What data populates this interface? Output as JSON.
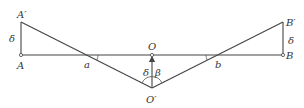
{
  "diagram": {
    "type": "geometry",
    "colors": {
      "line": "#444444",
      "text": "#333333",
      "background": "#ffffff"
    },
    "points": {
      "A_prime": {
        "label": "A′",
        "x": 21,
        "y": 22
      },
      "A": {
        "label": "A",
        "x": 21,
        "y": 55
      },
      "B_prime": {
        "label": "B′",
        "x": 283,
        "y": 22
      },
      "B": {
        "label": "B",
        "x": 283,
        "y": 55
      },
      "O": {
        "label": "O",
        "x": 152,
        "y": 55
      },
      "O_prime": {
        "label": "O′",
        "x": 152,
        "y": 88
      },
      "a": {
        "label": "a",
        "x": 87,
        "y": 55
      },
      "b": {
        "label": "b",
        "x": 217,
        "y": 55
      }
    },
    "labels": {
      "delta_left": "δ",
      "delta_right": "δ",
      "delta_center": "δ",
      "beta": "β"
    },
    "segments": [
      {
        "from": "A",
        "to": "B",
        "name": "horizontal-axis"
      },
      {
        "from": "A",
        "to": "A_prime",
        "name": "left-vertical"
      },
      {
        "from": "B",
        "to": "B_prime",
        "name": "right-vertical"
      },
      {
        "from": "A_prime",
        "to": "O_prime",
        "name": "left-diagonal"
      },
      {
        "from": "B_prime",
        "to": "O_prime",
        "name": "right-diagonal"
      },
      {
        "from": "O_prime",
        "to": "O",
        "name": "center-arrow"
      }
    ]
  }
}
